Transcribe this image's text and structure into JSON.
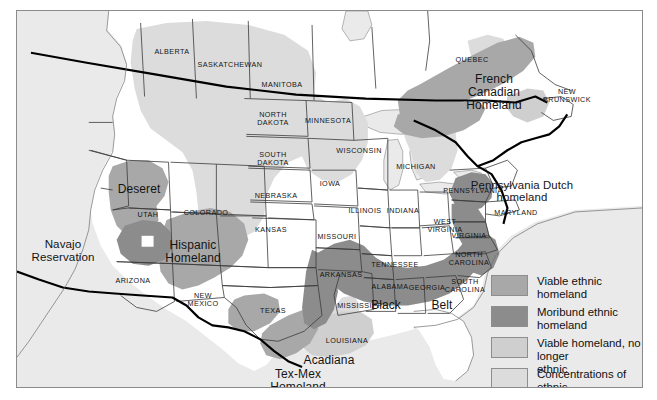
{
  "figure": {
    "kind": "thematic-map",
    "background_color": "#eaeaea",
    "frame_color": "#8b8b8b"
  },
  "palette": {
    "viable": "#a8a8a8",
    "moribund": "#8c8c8c",
    "no_longer_ethnic": "#cfcfcf",
    "islands": "#dcdcdc",
    "land": "#ffffff",
    "water": "#eaeaea",
    "outline": "#3a3a3a",
    "national_border": "#000000",
    "text": "#141414"
  },
  "legend": {
    "items": [
      {
        "label": "Viable ethnic homeland",
        "color": "#a8a8a8"
      },
      {
        "label": "Moribund ethnic homeland",
        "color": "#8c8c8c"
      },
      {
        "label": "Viable homeland, no longer\nethnic",
        "color": "#cfcfcf"
      },
      {
        "label": "Concentrations of ethnic\nislands",
        "color": "#dcdcdc"
      }
    ]
  },
  "region_labels": [
    {
      "name": "french-canadian-homeland",
      "text": "French\nCanadian\nHomeland",
      "x": 477,
      "y": 62,
      "size": "big"
    },
    {
      "name": "pennsylvania-dutch-homeland",
      "text": "Pennsylvania Dutch\nhomeland",
      "x": 505,
      "y": 168,
      "size": "note"
    },
    {
      "name": "deseret",
      "text": "Deseret",
      "x": 122,
      "y": 172,
      "size": "big"
    },
    {
      "name": "navajo-reservation",
      "text": "Navajo\nReservation",
      "x": 46,
      "y": 227,
      "size": "region"
    },
    {
      "name": "hispanic-homeland",
      "text": "Hispanic\nHomeland",
      "x": 176,
      "y": 228,
      "size": "big"
    },
    {
      "name": "black-belt-black",
      "text": "Black",
      "x": 369,
      "y": 288,
      "size": "big"
    },
    {
      "name": "black-belt-belt",
      "text": "Belt",
      "x": 425,
      "y": 288,
      "size": "big"
    },
    {
      "name": "acadiana",
      "text": "Acadiana",
      "x": 312,
      "y": 343,
      "size": "big"
    },
    {
      "name": "tex-mex-homeland",
      "text": "Tex-Mex\nHomeland",
      "x": 281,
      "y": 357,
      "size": "big"
    }
  ],
  "place_labels": [
    {
      "name": "alberta",
      "text": "ALBERTA",
      "x": 155,
      "y": 37
    },
    {
      "name": "saskatchewan",
      "text": "SASKATCHEWAN",
      "x": 213,
      "y": 50
    },
    {
      "name": "manitoba",
      "text": "MANITOBA",
      "x": 265,
      "y": 70
    },
    {
      "name": "quebec",
      "text": "QUEBEC",
      "x": 455,
      "y": 45
    },
    {
      "name": "new-brunswick",
      "text": "NEW\nBRUNSWICK",
      "x": 550,
      "y": 77
    },
    {
      "name": "north-dakota",
      "text": "NORTH\nDAKOTA",
      "x": 256,
      "y": 100
    },
    {
      "name": "minnesota",
      "text": "MINNESOTA",
      "x": 311,
      "y": 106
    },
    {
      "name": "south-dakota",
      "text": "SOUTH\nDAKOTA",
      "x": 256,
      "y": 140
    },
    {
      "name": "wisconsin",
      "text": "WISCONSIN",
      "x": 342,
      "y": 136
    },
    {
      "name": "michigan",
      "text": "MICHIGAN",
      "x": 399,
      "y": 152
    },
    {
      "name": "iowa",
      "text": "IOWA",
      "x": 313,
      "y": 169
    },
    {
      "name": "nebraska",
      "text": "NEBRASKA",
      "x": 259,
      "y": 181
    },
    {
      "name": "illinois",
      "text": "ILLINOIS",
      "x": 348,
      "y": 196
    },
    {
      "name": "indiana",
      "text": "INDIANA",
      "x": 386,
      "y": 196
    },
    {
      "name": "pennsylvania",
      "text": "PENNSYLVANIA",
      "x": 456,
      "y": 176
    },
    {
      "name": "utah",
      "text": "UTAH",
      "x": 131,
      "y": 200
    },
    {
      "name": "colorado",
      "text": "COLORADO",
      "x": 189,
      "y": 198
    },
    {
      "name": "kansas",
      "text": "KANSAS",
      "x": 254,
      "y": 215
    },
    {
      "name": "missouri",
      "text": "MISSOURI",
      "x": 320,
      "y": 222
    },
    {
      "name": "west-virginia",
      "text": "WEST\nVIRGINIA",
      "x": 428,
      "y": 207
    },
    {
      "name": "virginia",
      "text": "VIRGINIA",
      "x": 452,
      "y": 221
    },
    {
      "name": "maryland",
      "text": "MARYLAND",
      "x": 499,
      "y": 198
    },
    {
      "name": "arizona",
      "text": "ARIZONA",
      "x": 116,
      "y": 266
    },
    {
      "name": "new-mexico",
      "text": "NEW\nMEXICO",
      "x": 186,
      "y": 281
    },
    {
      "name": "arkansas",
      "text": "ARKANSAS",
      "x": 324,
      "y": 260
    },
    {
      "name": "tennessee",
      "text": "TENNESSEE",
      "x": 378,
      "y": 250
    },
    {
      "name": "north-carolina",
      "text": "NORTH\nCAROLINA",
      "x": 452,
      "y": 240
    },
    {
      "name": "alabama",
      "text": "ALABAMA",
      "x": 373,
      "y": 272
    },
    {
      "name": "georgia",
      "text": "GEORGIA",
      "x": 410,
      "y": 273
    },
    {
      "name": "south-carolina",
      "text": "SOUTH\nCAROLINA",
      "x": 448,
      "y": 267
    },
    {
      "name": "mississippi",
      "text": "MISSISSIPPI",
      "x": 344,
      "y": 291
    },
    {
      "name": "texas",
      "text": "TEXAS",
      "x": 256,
      "y": 296
    },
    {
      "name": "louisiana",
      "text": "LOUISIANA",
      "x": 330,
      "y": 326
    }
  ]
}
